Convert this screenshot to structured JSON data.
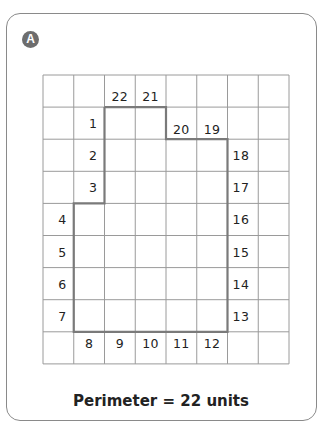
{
  "figure": {
    "label": "A",
    "caption": "Perimeter = 22 units"
  },
  "grid": {
    "columns": 8,
    "rows": 9,
    "line_color": "#9a9a9a",
    "outline_color": "#7a7a7a",
    "shape_cells_note": "rectilinear shape outlined on grid",
    "labels": [
      {
        "text": "22",
        "col": 2,
        "row": 0
      },
      {
        "text": "21",
        "col": 3,
        "row": 0
      },
      {
        "text": "1",
        "col": 1,
        "row": 1
      },
      {
        "text": "20",
        "col": 4,
        "row": 1
      },
      {
        "text": "19",
        "col": 5,
        "row": 1
      },
      {
        "text": "2",
        "col": 1,
        "row": 2
      },
      {
        "text": "18",
        "col": 6,
        "row": 2
      },
      {
        "text": "3",
        "col": 1,
        "row": 3
      },
      {
        "text": "17",
        "col": 6,
        "row": 3
      },
      {
        "text": "4",
        "col": 0,
        "row": 4
      },
      {
        "text": "16",
        "col": 6,
        "row": 4
      },
      {
        "text": "5",
        "col": 0,
        "row": 5
      },
      {
        "text": "15",
        "col": 6,
        "row": 5
      },
      {
        "text": "6",
        "col": 0,
        "row": 6
      },
      {
        "text": "14",
        "col": 6,
        "row": 6
      },
      {
        "text": "7",
        "col": 0,
        "row": 7
      },
      {
        "text": "13",
        "col": 6,
        "row": 7
      },
      {
        "text": "8",
        "col": 1,
        "row": 8
      },
      {
        "text": "9",
        "col": 2,
        "row": 8
      },
      {
        "text": "10",
        "col": 3,
        "row": 8
      },
      {
        "text": "11",
        "col": 4,
        "row": 8
      },
      {
        "text": "12",
        "col": 5,
        "row": 8
      }
    ]
  }
}
